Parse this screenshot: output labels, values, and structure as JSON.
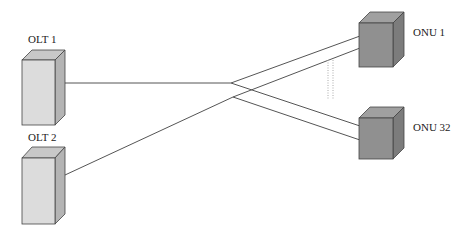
{
  "diagram": {
    "type": "PON topology",
    "nodes": {
      "olt1": {
        "label": "OLT 1",
        "kind": "OLT"
      },
      "olt2": {
        "label": "OLT 2",
        "kind": "OLT"
      },
      "onu1": {
        "label": "ONU 1",
        "kind": "ONU"
      },
      "onu32": {
        "label": "ONU 32",
        "kind": "ONU"
      }
    },
    "edges": [
      {
        "from": "OLT 1",
        "to": "ONU 1"
      },
      {
        "from": "OLT 1",
        "to": "ONU 32"
      },
      {
        "from": "OLT 2",
        "to": "ONU 1"
      },
      {
        "from": "OLT 2",
        "to": "ONU 32"
      }
    ],
    "ellipsis": "dotted vertical lines between ONU 1 and ONU 32"
  },
  "colors": {
    "olt_front": "#dcdcdc",
    "olt_top": "#c8c8c8",
    "olt_side": "#b4b4b4",
    "onu_front": "#909090",
    "onu_top": "#a0a0a0",
    "onu_side": "#7c7c7c",
    "line": "#555555"
  }
}
